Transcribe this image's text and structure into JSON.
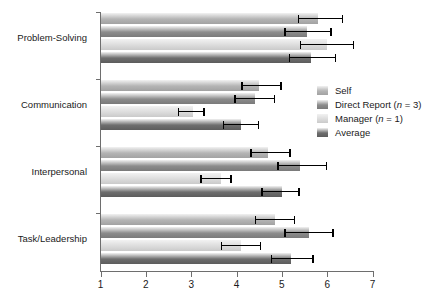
{
  "chart_data": {
    "type": "bar",
    "orientation": "horizontal",
    "title": "",
    "xlabel": "",
    "ylabel": "",
    "xlim": [
      1,
      7
    ],
    "xticks": [
      1,
      2,
      3,
      4,
      5,
      6,
      7
    ],
    "xticklabels": [
      "1",
      "2",
      "3",
      "4",
      "5",
      "6",
      "7"
    ],
    "grid": false,
    "legend_position": "right-middle",
    "categories": [
      "Problem-Solving",
      "Communication",
      "Interpersonal",
      "Task/Leadership"
    ],
    "series": [
      {
        "name": "Self",
        "color": "#b4b4b4",
        "values": [
          5.8,
          4.5,
          4.7,
          4.85
        ],
        "err_low": [
          5.35,
          4.1,
          4.3,
          4.4
        ],
        "err_high": [
          6.35,
          5.0,
          5.2,
          5.3
        ]
      },
      {
        "name": "Direct Report (n = 3)",
        "color": "#8c8c8c",
        "values": [
          5.55,
          4.4,
          5.4,
          5.6
        ],
        "err_low": [
          5.05,
          3.95,
          4.9,
          5.05
        ],
        "err_high": [
          6.1,
          4.85,
          6.0,
          6.15
        ]
      },
      {
        "name": "Manager (n = 1)",
        "color": "#dcdcdc",
        "values": [
          6.0,
          3.05,
          3.65,
          4.1
        ],
        "err_low": [
          5.4,
          2.7,
          3.2,
          3.65
        ],
        "err_high": [
          6.6,
          3.3,
          3.9,
          4.55
        ]
      },
      {
        "name": "Average",
        "color": "#6e6e6e",
        "values": [
          5.65,
          4.1,
          5.0,
          5.2
        ],
        "err_low": [
          5.15,
          3.7,
          4.55,
          4.75
        ],
        "err_high": [
          6.2,
          4.5,
          5.4,
          5.7
        ]
      }
    ]
  },
  "legend": {
    "items": [
      {
        "label": "Self",
        "n": ""
      },
      {
        "label": "Direct Report (",
        "n": "n",
        "tail": " = 3)"
      },
      {
        "label": "Manager (",
        "n": "n",
        "tail": " = 1)"
      },
      {
        "label": "Average",
        "n": ""
      }
    ]
  }
}
